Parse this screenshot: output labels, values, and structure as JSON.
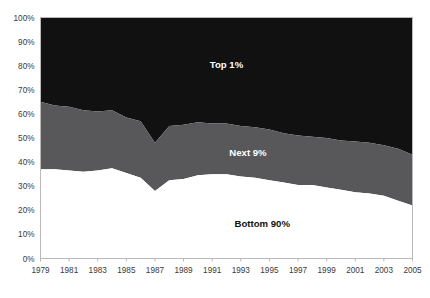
{
  "chart_data": {
    "type": "area",
    "stacked": true,
    "title": "",
    "subtitle": "",
    "xlabel": "",
    "ylabel": "",
    "xlim": [
      1979,
      2005
    ],
    "ylim": [
      0,
      100
    ],
    "grid": false,
    "legend_position": "inline-annotation",
    "x": [
      1979,
      1980,
      1981,
      1982,
      1983,
      1984,
      1985,
      1986,
      1987,
      1988,
      1989,
      1990,
      1991,
      1992,
      1993,
      1994,
      1995,
      1996,
      1997,
      1998,
      1999,
      2000,
      2001,
      2002,
      2003,
      2004,
      2005
    ],
    "x_tick_labels": [
      "1979",
      "1981",
      "1983",
      "1985",
      "1987",
      "1989",
      "1991",
      "1993",
      "1995",
      "1997",
      "1999",
      "2001",
      "2003",
      "2005"
    ],
    "y_tick_labels": [
      "0%",
      "10%",
      "20%",
      "30%",
      "40%",
      "50%",
      "60%",
      "70%",
      "80%",
      "90%",
      "100%"
    ],
    "y_ticks": [
      0,
      10,
      20,
      30,
      40,
      50,
      60,
      70,
      80,
      90,
      100
    ],
    "series": [
      {
        "name": "Bottom 90%",
        "label": "Bottom 90%",
        "color": "#ffffff",
        "label_color": "#111111",
        "values": [
          37,
          37,
          36.5,
          36,
          36.5,
          37.5,
          35.5,
          33.5,
          28,
          32.5,
          33,
          34.5,
          35,
          35,
          34,
          33.5,
          32.5,
          31.5,
          30.5,
          30.5,
          29.5,
          28.5,
          27.5,
          27,
          26,
          24,
          22
        ]
      },
      {
        "name": "Next 9%",
        "label": "Next 9%",
        "color": "#58585a",
        "label_color": "#ffffff",
        "values": [
          28,
          26.5,
          26.5,
          25.5,
          24.5,
          24,
          23,
          23.5,
          20,
          22.5,
          22.5,
          22,
          21,
          21,
          21,
          21,
          21,
          20.5,
          20.5,
          20,
          20.5,
          20.5,
          21,
          21,
          21,
          21.5,
          21
        ]
      },
      {
        "name": "Top 1%",
        "label": "Top 1%",
        "color": "#111111",
        "label_color": "#ffffff",
        "values": [
          35,
          36.5,
          37,
          38.5,
          39,
          38.5,
          41.5,
          43,
          52,
          45,
          44.5,
          43.5,
          44,
          44,
          45,
          45.5,
          46.5,
          48,
          49,
          49.5,
          50,
          51,
          51.5,
          52,
          53,
          54.5,
          57
        ]
      }
    ],
    "boundaries": {
      "bottom90_top": [
        37,
        37,
        36.5,
        36,
        36.5,
        37.5,
        35.5,
        33.5,
        28,
        32.5,
        33,
        34.5,
        35,
        35,
        34,
        33.5,
        32.5,
        31.5,
        30.5,
        30.5,
        29.5,
        28.5,
        27.5,
        27,
        26,
        24,
        22
      ],
      "next9_top": [
        65,
        63.5,
        63,
        61.5,
        61,
        61.5,
        58.5,
        57,
        48,
        55,
        55.5,
        56.5,
        56,
        56,
        55,
        54.5,
        53.5,
        52,
        51,
        50.5,
        50,
        49,
        48.5,
        48,
        47,
        45.5,
        43
      ]
    },
    "annotations": [
      {
        "text": "Top 1%",
        "x_value": 1992,
        "y_value": 79,
        "style": "light"
      },
      {
        "text": "Next 9%",
        "x_value": 1993.5,
        "y_value": 42.5,
        "style": "light"
      },
      {
        "text": "Bottom 90%",
        "x_value": 1994.5,
        "y_value": 13,
        "style": "dark"
      }
    ]
  }
}
